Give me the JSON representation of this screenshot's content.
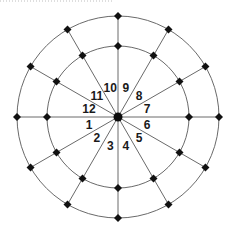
{
  "diagram": {
    "center": {
      "x": 118,
      "y": 117
    },
    "inner_ring_radius": 71,
    "outer_ring_radius": 101,
    "spoke_count": 12,
    "spoke_angle_step_deg": 30,
    "node_shape": "diamond",
    "node_size": 8,
    "hub_radius": 4.5,
    "colors": {
      "line": "#6a6a6a",
      "node": "#111111",
      "label": "#1a1a1a",
      "background": "#ffffff"
    },
    "sector_labels": [
      {
        "text": "1",
        "angle_deg": 195
      },
      {
        "text": "2",
        "angle_deg": 225
      },
      {
        "text": "3",
        "angle_deg": 255
      },
      {
        "text": "4",
        "angle_deg": 285
      },
      {
        "text": "5",
        "angle_deg": 315
      },
      {
        "text": "6",
        "angle_deg": 345
      },
      {
        "text": "7",
        "angle_deg": 15
      },
      {
        "text": "8",
        "angle_deg": 45
      },
      {
        "text": "9",
        "angle_deg": 75
      },
      {
        "text": "10",
        "angle_deg": 105
      },
      {
        "text": "11",
        "angle_deg": 135
      },
      {
        "text": "12",
        "angle_deg": 165
      }
    ],
    "label_radius": 30
  }
}
